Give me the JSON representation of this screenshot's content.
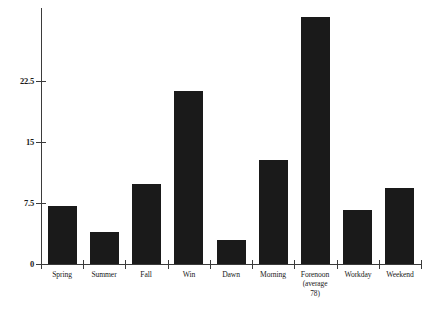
{
  "chart_data": {
    "type": "bar",
    "title": "",
    "subtitle": "",
    "xlabel": "",
    "ylabel": "",
    "ylim": [
      0,
      31.5
    ],
    "grid": false,
    "legend": "none",
    "yticks": [
      "0",
      "7.5",
      "15",
      "22.5"
    ],
    "ytick_values": [
      0,
      7.5,
      15,
      22.5
    ],
    "categories": [
      "Spring",
      "Summer",
      "Fall",
      "Win",
      "Dawn",
      "Morning",
      "Forenoon",
      "Workday",
      "Weekend"
    ],
    "values": [
      7.1,
      3.9,
      9.8,
      21.3,
      2.9,
      12.8,
      30.4,
      6.6,
      9.4
    ],
    "annotations": [
      {
        "category": "Forenoon",
        "lines": [
          "(average",
          "78)"
        ]
      }
    ],
    "bar_color": "#1a1a1a",
    "axis_color": "#3b3b3b",
    "background_color": "#ffffff"
  },
  "axis": {
    "tick_0": "0",
    "tick_1": "7.5",
    "tick_2": "15",
    "tick_3": "22.5"
  },
  "labels": {
    "cat_0": "Spring",
    "cat_1": "Summer",
    "cat_2": "Fall",
    "cat_3": "Win",
    "cat_4": "Dawn",
    "cat_5": "Morning",
    "cat_6": "Forenoon",
    "cat_6_note_1": "(average",
    "cat_6_note_2": "78)",
    "cat_7": "Workday",
    "cat_8": "Weekend"
  }
}
